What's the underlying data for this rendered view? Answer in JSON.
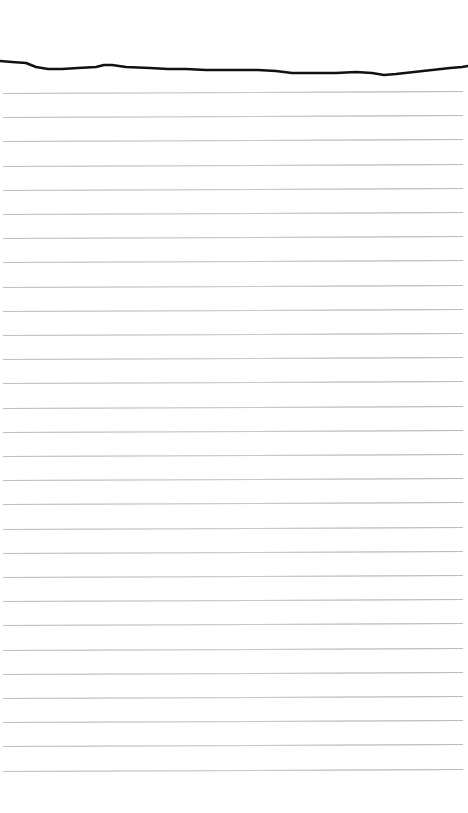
{
  "page": {
    "background_color": "#ffffff",
    "width": 468,
    "height": 813,
    "content_text": ""
  },
  "paper": {
    "type": "ruled-paper",
    "rule_color": "#c9c9ce",
    "rule_thickness_px": 1,
    "rule_spacing_px": 24.2,
    "rule_count": 29,
    "first_rule_y": 93,
    "rule_left_x": 3,
    "rule_right_x": 463,
    "rule_slope_px": -2,
    "top_margin_px": 60,
    "is_blank": true
  },
  "torn_edge": {
    "name": "torn-top-edge",
    "color": "#111111",
    "stroke_width_px": 2.6,
    "top_y": 54,
    "height_px": 28,
    "path_points": [
      [
        0,
        7
      ],
      [
        12,
        8
      ],
      [
        26,
        9
      ],
      [
        36,
        13
      ],
      [
        48,
        15
      ],
      [
        62,
        15
      ],
      [
        78,
        14
      ],
      [
        96,
        13
      ],
      [
        104,
        11
      ],
      [
        112,
        11
      ],
      [
        126,
        13
      ],
      [
        150,
        14
      ],
      [
        168,
        15
      ],
      [
        186,
        15
      ],
      [
        206,
        16
      ],
      [
        232,
        16
      ],
      [
        258,
        16
      ],
      [
        276,
        17
      ],
      [
        292,
        19
      ],
      [
        312,
        19
      ],
      [
        336,
        19
      ],
      [
        356,
        18
      ],
      [
        372,
        19
      ],
      [
        384,
        21
      ],
      [
        396,
        20
      ],
      [
        414,
        18
      ],
      [
        432,
        16
      ],
      [
        450,
        14
      ],
      [
        462,
        13
      ],
      [
        468,
        12
      ]
    ]
  }
}
